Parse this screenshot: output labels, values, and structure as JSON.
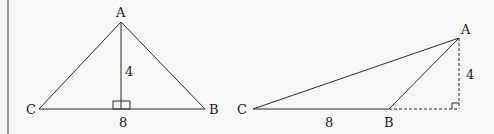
{
  "colors": {
    "background": "#f7f7f5",
    "stroke": "#2a2a2a",
    "text": "#1a1a1a"
  },
  "figure_left": {
    "description": "Triangle ABC with altitude from A perpendicular to CB",
    "vertices": {
      "A": "A",
      "B": "B",
      "C": "C"
    },
    "altitude_label": "4",
    "base_label": "8",
    "right_angle_marker": true
  },
  "figure_right": {
    "description": "Obtuse triangle ABC with external altitude from A to the extension of CB (dashed)",
    "vertices": {
      "A": "A",
      "B": "B",
      "C": "C"
    },
    "altitude_label": "4",
    "base_label": "8",
    "right_angle_marker": true,
    "altitude_style": "dashed"
  }
}
